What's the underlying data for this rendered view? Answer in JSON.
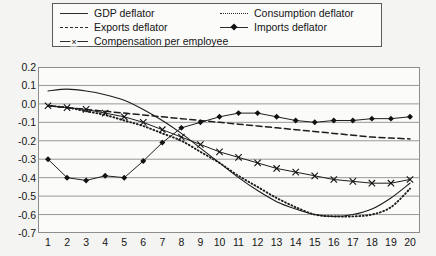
{
  "legend": {
    "items": [
      {
        "label": "GDP deflator",
        "key": "solid-line"
      },
      {
        "label": "Consumption deflator",
        "key": "dotted-line"
      },
      {
        "label": "Exports deflator",
        "key": "dashed-line"
      },
      {
        "label": "Imports deflator",
        "key": "line-with-diamond-markers"
      },
      {
        "label": "Compensation per employee",
        "key": "line-with-x-markers"
      }
    ]
  },
  "chart_data": {
    "type": "line",
    "title": "",
    "xlabel": "",
    "ylabel": "",
    "xlim": [
      1,
      20
    ],
    "ylim": [
      -0.7,
      0.2
    ],
    "ytick_labels": [
      "0.2",
      "0.1",
      "0.0",
      "-0.1",
      "-0.2",
      "-0.3",
      "-0.4",
      "-0.5",
      "-0.6",
      "-0.7"
    ],
    "yticks": [
      0.2,
      0.1,
      0.0,
      -0.1,
      -0.2,
      -0.3,
      -0.4,
      -0.5,
      -0.6,
      -0.7
    ],
    "grid": true,
    "legend_position": "top",
    "x": [
      1,
      2,
      3,
      4,
      5,
      6,
      7,
      8,
      9,
      10,
      11,
      12,
      13,
      14,
      15,
      16,
      17,
      18,
      19,
      20
    ],
    "series": [
      {
        "name": "GDP deflator",
        "style": "solid",
        "values": [
          0.07,
          0.08,
          0.07,
          0.05,
          0.02,
          -0.03,
          -0.09,
          -0.16,
          -0.24,
          -0.32,
          -0.4,
          -0.47,
          -0.53,
          -0.57,
          -0.6,
          -0.61,
          -0.6,
          -0.57,
          -0.51,
          -0.43
        ]
      },
      {
        "name": "Consumption deflator",
        "style": "dotted",
        "values": [
          -0.01,
          -0.02,
          -0.04,
          -0.06,
          -0.09,
          -0.12,
          -0.16,
          -0.2,
          -0.26,
          -0.32,
          -0.39,
          -0.45,
          -0.51,
          -0.56,
          -0.6,
          -0.61,
          -0.61,
          -0.6,
          -0.56,
          -0.46
        ]
      },
      {
        "name": "Exports deflator",
        "style": "dashed",
        "values": [
          -0.01,
          -0.02,
          -0.03,
          -0.04,
          -0.05,
          -0.06,
          -0.07,
          -0.08,
          -0.09,
          -0.1,
          -0.11,
          -0.12,
          -0.13,
          -0.14,
          -0.15,
          -0.16,
          -0.17,
          -0.18,
          -0.185,
          -0.19
        ]
      },
      {
        "name": "Imports deflator",
        "style": "solid-diamond",
        "values": [
          -0.3,
          -0.4,
          -0.415,
          -0.39,
          -0.4,
          -0.31,
          -0.21,
          -0.13,
          -0.1,
          -0.07,
          -0.05,
          -0.05,
          -0.07,
          -0.09,
          -0.1,
          -0.09,
          -0.09,
          -0.08,
          -0.08,
          -0.07
        ]
      },
      {
        "name": "Compensation per employee",
        "style": "solid-x",
        "values": [
          -0.01,
          -0.02,
          -0.03,
          -0.05,
          -0.07,
          -0.1,
          -0.14,
          -0.18,
          -0.22,
          -0.26,
          -0.29,
          -0.32,
          -0.35,
          -0.37,
          -0.39,
          -0.41,
          -0.42,
          -0.43,
          -0.43,
          -0.41
        ]
      }
    ]
  }
}
